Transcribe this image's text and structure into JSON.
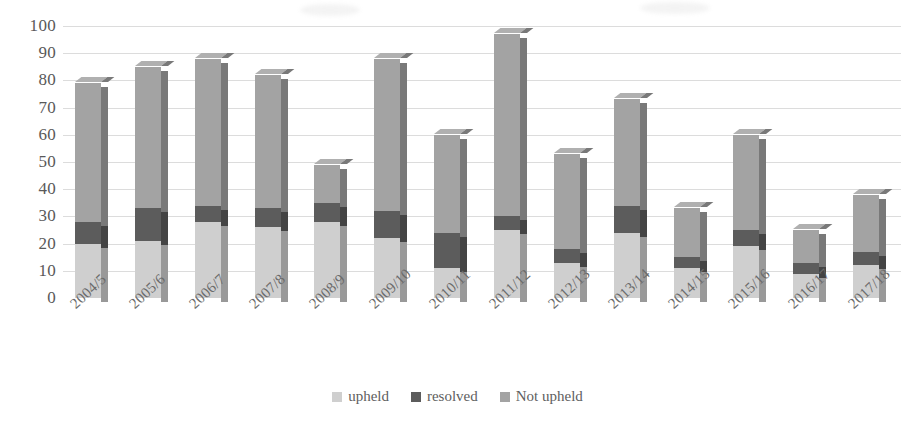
{
  "chart_data": {
    "type": "bar",
    "stacked": true,
    "title": "",
    "xlabel": "",
    "ylabel": "",
    "ylim": [
      0,
      100
    ],
    "ytick_step": 10,
    "yticks": [
      "0",
      "10",
      "20",
      "30",
      "40",
      "50",
      "60",
      "70",
      "80",
      "90",
      "100"
    ],
    "grid": true,
    "legend_position": "bottom",
    "categories": [
      "2004/5",
      "2005/6",
      "2006/7",
      "2007/8",
      "2008/9",
      "2009/10",
      "2010/11",
      "2011/12",
      "2012/13",
      "2013/14",
      "2014/15",
      "2015/16",
      "2016/17",
      "2017/18"
    ],
    "series": [
      {
        "name": "upheld",
        "color": "#cfcfcf",
        "values": [
          20,
          21,
          28,
          26,
          28,
          22,
          11,
          25,
          13,
          24,
          11,
          19,
          9,
          12
        ]
      },
      {
        "name": "resolved",
        "color": "#5c5c5c",
        "values": [
          8,
          12,
          6,
          7,
          7,
          10,
          13,
          5,
          5,
          10,
          4,
          6,
          4,
          5
        ]
      },
      {
        "name": "Not upheld",
        "color": "#a3a3a3",
        "values": [
          51,
          52,
          54,
          49,
          14,
          56,
          36,
          67,
          35,
          39,
          18,
          35,
          12,
          21
        ]
      }
    ],
    "totals": [
      79,
      85,
      88,
      82,
      49,
      88,
      60,
      97,
      53,
      73,
      33,
      60,
      25,
      38
    ]
  },
  "legend": {
    "items": [
      {
        "label": "upheld",
        "color": "#cfcfcf"
      },
      {
        "label": "resolved",
        "color": "#5c5c5c"
      },
      {
        "label": "Not upheld",
        "color": "#a3a3a3"
      }
    ]
  },
  "colors": {
    "upheld": "#cfcfcf",
    "resolved": "#5c5c5c",
    "not_upheld": "#a3a3a3",
    "grid": "#dcdcdc",
    "text": "#595959",
    "background": "#ffffff"
  }
}
